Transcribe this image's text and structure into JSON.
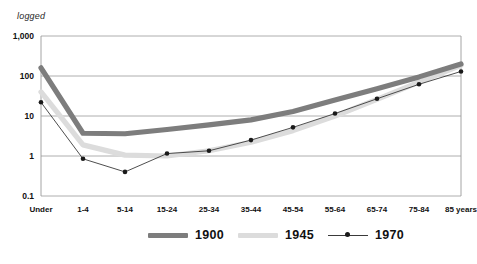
{
  "chart_data": {
    "type": "line",
    "title": "",
    "subtitle": "",
    "xlabel": "",
    "ylabel": "logged",
    "scale": "log",
    "ylim": [
      0.1,
      1000
    ],
    "yticks": [
      "0.1",
      "1",
      "10",
      "100",
      "1,000"
    ],
    "ytick_values": [
      0.1,
      1,
      10,
      100,
      1000
    ],
    "grid": true,
    "grid_axis": "y",
    "legend_position": "bottom-center",
    "categories": [
      "Under",
      "1-4",
      "5-14",
      "15-24",
      "25-34",
      "35-44",
      "45-54",
      "55-64",
      "65-74",
      "75-84",
      "85 years"
    ],
    "series": [
      {
        "name": "1900",
        "color": "#7d7d7d",
        "style": "thick-line",
        "values": [
          160,
          3.7,
          3.6,
          4.6,
          6.0,
          8.0,
          13,
          25,
          48,
          95,
          200
        ]
      },
      {
        "name": "1945",
        "color": "#dcdcdc",
        "style": "thick-line",
        "values": [
          40,
          1.9,
          1.05,
          1.0,
          1.35,
          2.2,
          4.3,
          10,
          26,
          70,
          185
        ]
      },
      {
        "name": "1970",
        "color": "#3a3a3a",
        "style": "thin-line-with-markers",
        "values": [
          22,
          0.85,
          0.4,
          1.15,
          1.35,
          2.5,
          5.2,
          11.5,
          27,
          62,
          130
        ]
      }
    ],
    "annotations": []
  },
  "axis": {
    "y_note": "logged"
  },
  "legend": {
    "items": [
      {
        "label": "1900"
      },
      {
        "label": "1945"
      },
      {
        "label": "1970"
      }
    ]
  },
  "caption": {
    "text": ""
  }
}
